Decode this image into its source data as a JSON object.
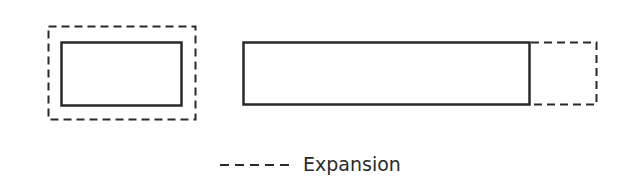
{
  "diagram": {
    "colors": {
      "stroke": "#2a2a2a",
      "background": "#ffffff"
    },
    "shapes": [
      {
        "id": "uniform-expansion-outer",
        "style": "dashed",
        "x": 48,
        "y": 26,
        "w": 147,
        "h": 93
      },
      {
        "id": "original-rect-small",
        "style": "solid",
        "x": 61,
        "y": 42,
        "w": 120,
        "h": 63
      },
      {
        "id": "original-rect-long",
        "style": "solid",
        "x": 243,
        "y": 42,
        "w": 286,
        "h": 62
      },
      {
        "id": "directional-expansion",
        "style": "dashed",
        "x": 529,
        "y": 42,
        "w": 67,
        "h": 62
      }
    ],
    "legend": {
      "symbol": "dashed-line",
      "label": "Expansion"
    }
  }
}
